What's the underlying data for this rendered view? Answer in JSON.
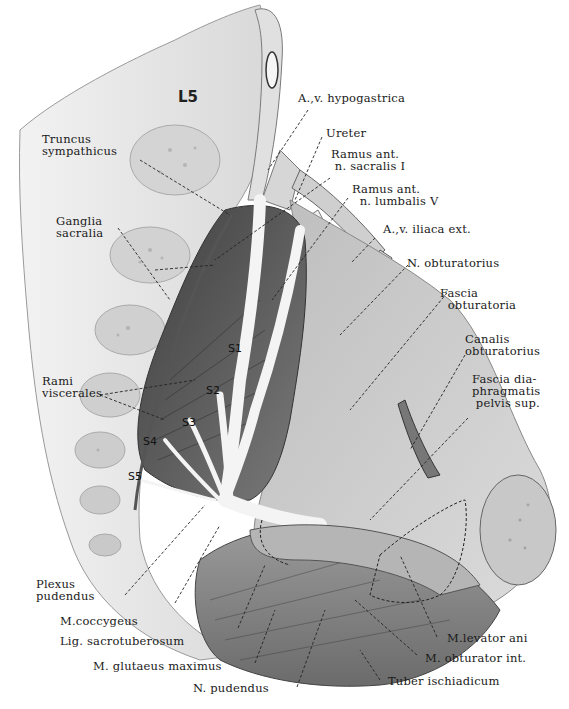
{
  "figure": {
    "palette": {
      "background": "#ffffff",
      "bone_light": "#e6e6e6",
      "bone_mid": "#cfcfcf",
      "muscle_dark": "#555555",
      "muscle_mid": "#8a8a8a",
      "fascia": "#c4c4c4",
      "nerve": "#f0f0f0",
      "leader_line": "#222222"
    }
  },
  "vertebra_label": "L5",
  "segment_labels": [
    "S1",
    "S2",
    "S3",
    "S4",
    "S5"
  ],
  "labels": {
    "hypogastrica": "A.,v. hypogastrica",
    "ureter": "Ureter",
    "ramus_sacralis": "Ramus ant.\n n. sacralis I",
    "ramus_lumbalis": "Ramus ant.\n  n. lumbalis V",
    "iliaca_ext": "A.,v. iliaca ext.",
    "n_obturatorius": "N. obturatorius",
    "fascia_obturatoria": "Fascia\n  obturatoria",
    "canalis_obturatorius": "Canalis\nobturatorius",
    "fascia_diaphragmatis": "Fascia dia-\nphragmatis\n pelvis sup.",
    "truncus_sympathicus": "Truncus\nsympathicus",
    "ganglia_sacralia": "Ganglia\nsacralia",
    "rami_viscerales": "Rami\nviscerales",
    "plexus_pudendus": "Plexus\npudendus",
    "m_coccygeus": "M.coccygeus",
    "lig_sacrotuberosum": "Lig. sacrotuberosum",
    "m_glutaeus_maximus": "M. glutaeus maximus",
    "n_pudendus": "N. pudendus",
    "m_levator_ani": "M.levator ani",
    "m_obturator_int": "M. obturator int.",
    "tuber_ischiadicum": "Tuber ischiadicum"
  }
}
